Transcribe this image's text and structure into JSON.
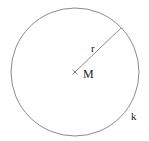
{
  "diagram": {
    "type": "circle-with-radius",
    "circle": {
      "label": "k",
      "cx": 75,
      "cy": 72,
      "r": 64,
      "stroke": "#8a8a8a"
    },
    "center": {
      "label": "M",
      "marker": "×",
      "x": 75,
      "y": 72
    },
    "radius": {
      "label": "r",
      "x1": 75,
      "y1": 72,
      "x2": 121,
      "y2": 28,
      "stroke": "#8a8a8a"
    }
  }
}
